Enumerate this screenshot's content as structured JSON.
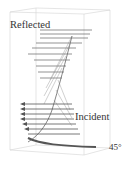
{
  "figure": {
    "labels": {
      "reflected": "Reflected",
      "incident": "Incident",
      "angle": "45°"
    },
    "colors": {
      "box": "#d0d0d0",
      "arrows": "#555555",
      "text": "#333333"
    }
  }
}
